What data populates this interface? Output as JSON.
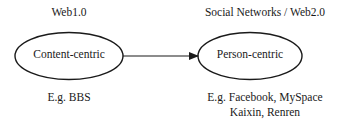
{
  "left": {
    "title": "Web1.0",
    "node": "Content-centric",
    "example": "E.g. BBS"
  },
  "right": {
    "title": "Social Networks / Web2.0",
    "node": "Person-centric",
    "example_line1": "E.g. Facebook, MySpace",
    "example_line2": "Kaixin,  Renren"
  },
  "colors": {
    "stroke": "#1a1a1a",
    "background": "#ffffff"
  }
}
